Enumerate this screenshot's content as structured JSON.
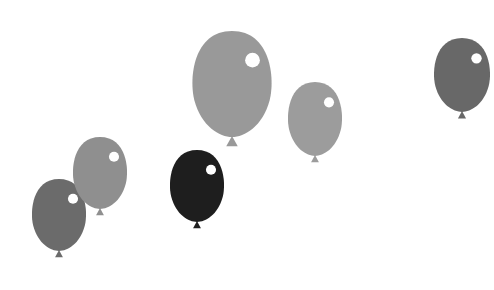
{
  "scene": {
    "background": "#ffffff",
    "balloons": [
      {
        "id": "b1",
        "cx": 59,
        "cy": 215,
        "rx": 28,
        "ry": 36,
        "color": "#6b6b6b"
      },
      {
        "id": "b2",
        "cx": 100,
        "cy": 173,
        "rx": 28,
        "ry": 36,
        "color": "#8f8f8f"
      },
      {
        "id": "b3",
        "cx": 197,
        "cy": 186,
        "rx": 28,
        "ry": 36,
        "color": "#1e1e1e"
      },
      {
        "id": "b4",
        "cx": 232,
        "cy": 84,
        "rx": 41,
        "ry": 53,
        "color": "#999999"
      },
      {
        "id": "b5",
        "cx": 315,
        "cy": 119,
        "rx": 28,
        "ry": 37,
        "color": "#9c9c9c"
      },
      {
        "id": "b6",
        "cx": 462,
        "cy": 75,
        "rx": 29,
        "ry": 37,
        "color": "#686868"
      }
    ]
  }
}
